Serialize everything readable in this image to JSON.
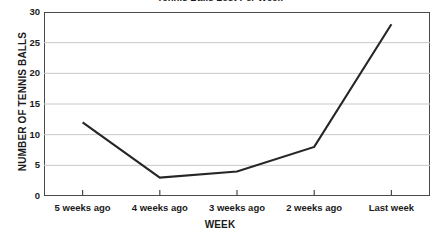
{
  "chart_data": {
    "type": "line",
    "title": "Tennis Balls Lost Per Week",
    "xlabel": "WEEK",
    "ylabel": "NUMBER OF TENNIS BALLS",
    "categories": [
      "5 weeks ago",
      "4 weeks ago",
      "3 weeks ago",
      "2 weeks ago",
      "Last week"
    ],
    "values": [
      12,
      3,
      4,
      8,
      28
    ],
    "series": [
      {
        "name": "Tennis balls lost",
        "values": [
          12,
          3,
          4,
          8,
          28
        ]
      }
    ],
    "ylim": [
      0,
      30
    ],
    "ytick_labels": [
      "0",
      "5",
      "10",
      "15",
      "20",
      "25",
      "30"
    ],
    "ytick_values": [
      0,
      5,
      10,
      15,
      20,
      25,
      30
    ],
    "ytick_interval": 5,
    "grid": "horizontal",
    "legend": "none",
    "markers": "none",
    "colors": {
      "line": "#262626",
      "gridline": "#c8c8c8",
      "frame": "#4a4a4a",
      "background": "#ffffff",
      "text": "#1a1a1a"
    }
  }
}
